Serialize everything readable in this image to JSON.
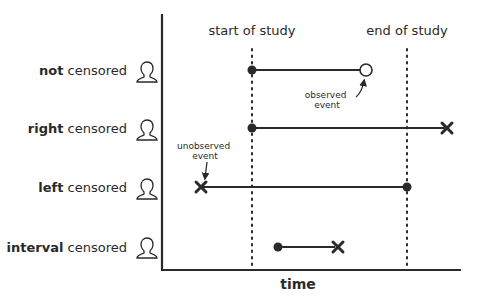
{
  "diagram": {
    "axes": {
      "x_label": "time"
    },
    "markers": {
      "start": {
        "label": "start of study"
      },
      "end": {
        "label": "end of study"
      }
    },
    "rows": [
      {
        "bold": "not",
        "rest": " censored"
      },
      {
        "bold": "right",
        "rest": " censored"
      },
      {
        "bold": "left",
        "rest": " censored"
      },
      {
        "bold": "interval",
        "rest": " censored"
      }
    ],
    "annotations": {
      "observed": {
        "line1": "observed",
        "line2": "event"
      },
      "unobserved": {
        "line1": "unobserved",
        "line2": "event"
      }
    },
    "colors": {
      "ink": "#2a2a2a",
      "background": "#ffffff"
    }
  }
}
